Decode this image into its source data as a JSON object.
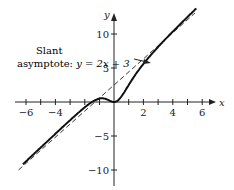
{
  "chart_data": {
    "type": "line",
    "title": "",
    "xlabel": "x",
    "ylabel": "y",
    "xlim": [
      -7,
      7
    ],
    "ylim": [
      -11,
      13
    ],
    "x_ticks": [
      -6,
      -5,
      -4,
      -3,
      -2,
      -1,
      1,
      2,
      3,
      4,
      5,
      6
    ],
    "x_tick_labels": [
      "-6",
      "-4",
      "2",
      "4",
      "6"
    ],
    "y_ticks": [
      10,
      5,
      -5,
      -10
    ],
    "y_tick_labels": [
      "10",
      "5",
      "−5",
      "−10"
    ],
    "grid": false,
    "series": [
      {
        "name": "f(x)",
        "style": "solid",
        "description": "curve with local max near x=-1 (y≈0.6) and local min at origin (0,0), approaching slant asymptote"
      },
      {
        "name": "y = 2x + 3",
        "style": "dashed",
        "slope": 2,
        "intercept": 3
      }
    ],
    "annotations": [
      {
        "text": "Slant asymptote: y = 2x + 3",
        "arrow_to": "dashed line near x=1.8"
      }
    ]
  },
  "labels": {
    "annotation_line1": "Slant",
    "annotation_line2_prefix": "asymptote: ",
    "annotation_eq": "y = 2x + 3",
    "x_axis": "x",
    "y_axis": "y",
    "xt_m6": "−6",
    "xt_m4": "−4",
    "xt_2": "2",
    "xt_4": "4",
    "xt_6": "6",
    "yt_10": "10",
    "yt_5": "5",
    "yt_m5": "−5",
    "yt_m10": "−10"
  }
}
